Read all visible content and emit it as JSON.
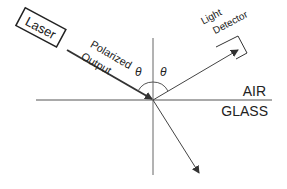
{
  "diagram": {
    "laser_label": "Laser",
    "incident_label_line1": "Polarized",
    "incident_label_line2": "Output",
    "theta_incident": "θ",
    "theta_reflected": "θ",
    "detector_label_line1": "Light",
    "detector_label_line2": "Detector",
    "upper_medium": "AIR",
    "lower_medium": "GLASS",
    "colors": {
      "line": "#333333",
      "axis": "#555555",
      "background": "#ffffff"
    }
  }
}
